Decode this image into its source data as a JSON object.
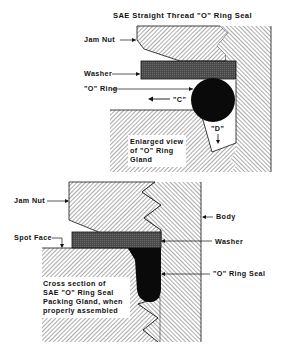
{
  "title": "SAE Straight Thread \"O\" Ring Seal",
  "top_figure": {
    "labels": {
      "jam_nut": "Jam Nut",
      "washer": "Washer",
      "o_ring": "\"O\" Ring",
      "dim_c": "\"C\"",
      "dim_d": "\"D\""
    },
    "caption": [
      "Enlarged view",
      "of \"O\" Ring",
      "Gland"
    ]
  },
  "bottom_figure": {
    "labels": {
      "jam_nut": "Jam Nut",
      "spot_face": "Spot Face",
      "body": "Body",
      "washer": "Washer",
      "o_ring_seal": "\"O\" Ring Seal"
    },
    "caption": [
      "Cross section of",
      "SAE \"O\" Ring Seal",
      "Packing Gland, when",
      "properly assembled"
    ]
  },
  "colors": {
    "ink": "#111111",
    "washer": "#555555",
    "hatch": "#444444",
    "background": "#ffffff"
  }
}
